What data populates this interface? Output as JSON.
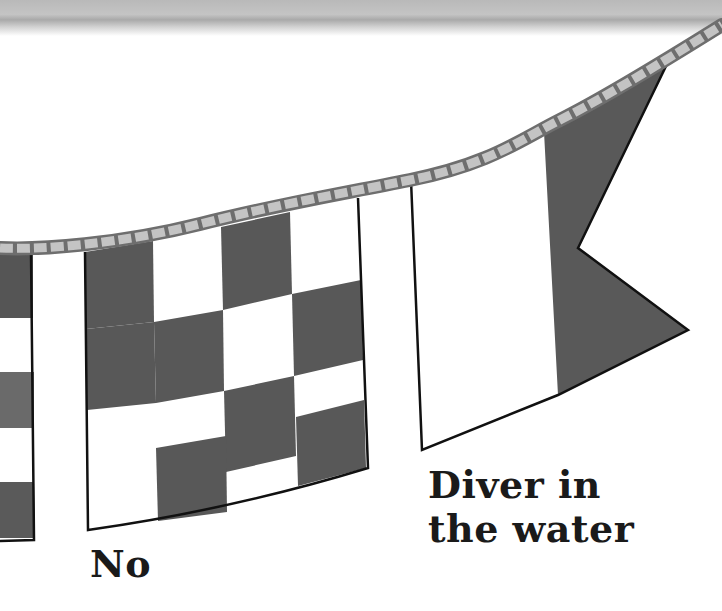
{
  "illustration": {
    "topic": "Nautical signal flags on a rope line",
    "colors": {
      "dark_fill": "#5a5a5a",
      "light_fill": "#ffffff",
      "outline": "#111111",
      "rope_fill": "#c2c2c2",
      "rope_stroke": "#6e6e6e",
      "top_band": "#bdbdbd"
    },
    "flags": [
      {
        "id": "partial-left",
        "pattern": "horizontal stripes (dark/white)",
        "label": ""
      },
      {
        "id": "checkered",
        "pattern": "4x4 checkerboard (dark/white)",
        "label": "No"
      },
      {
        "id": "swallowtail",
        "pattern": "white hoist, dark swallowtail fly",
        "label_lines": [
          "Diver in",
          "the water"
        ]
      }
    ]
  },
  "labels": {
    "no": "No",
    "diver_line1": "Diver in",
    "diver_line2": "the water"
  }
}
